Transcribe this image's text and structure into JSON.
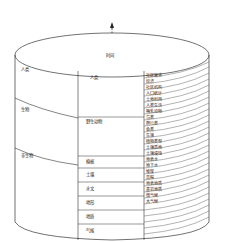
{
  "diagram": {
    "axis_label": "时间",
    "categories": [
      {
        "label": "人类",
        "groups": [
          {
            "label": "人类",
            "items": [
              "社区需求",
              "经济",
              "社区机构",
              "人口统计",
              "土地利用",
              "人类生活"
            ]
          }
        ]
      },
      {
        "label": "生物",
        "groups": [
          {
            "label": "野生动物",
            "items": [
              "哺乳动物",
              "鸟类",
              "爬行类",
              "鱼类"
            ]
          },
          {
            "label": "植被",
            "items": [
              "生境",
              "植物类型"
            ]
          }
        ]
      },
      {
        "label": "非生物",
        "groups": [
          {
            "label": "土壤",
            "items": [
              "土壤质地",
              "土壤侵蚀"
            ]
          },
          {
            "label": "水文",
            "items": [
              "地表水",
              "地下水"
            ]
          },
          {
            "label": "地形",
            "items": [
              "坡度",
              "高程"
            ]
          },
          {
            "label": "地质",
            "items": [
              "地表地质",
              "基岩地质"
            ]
          },
          {
            "label": "气候",
            "items": [
              "微气候",
              "大气候"
            ]
          }
        ]
      }
    ],
    "c0": "人类",
    "c1": "生物",
    "c2": "非生物",
    "g0": "人类",
    "g1": "野生动物",
    "g2": "植被",
    "g3": "土壤",
    "g4": "水文",
    "g5": "地形",
    "g6": "地质",
    "g7": "气候",
    "i": [
      "社区需求",
      "经济",
      "社区机构",
      "人口统计",
      "土地利用",
      "人类生活",
      "哺乳动物",
      "鸟类",
      "爬行类",
      "鱼类",
      "生境",
      "植物类型",
      "土壤质地",
      "土壤侵蚀",
      "地表水",
      "地下水",
      "坡度",
      "高程",
      "地表地质",
      "基岩地质",
      "微气候",
      "大气候"
    ]
  }
}
